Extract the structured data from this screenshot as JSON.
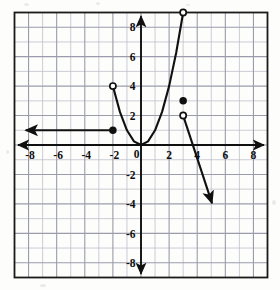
{
  "chart_data": {
    "type": "line",
    "title": "",
    "xlabel": "",
    "ylabel": "",
    "xlim": [
      -9,
      9
    ],
    "ylim": [
      -9,
      9
    ],
    "grid": true,
    "grid_step": 1,
    "tick_step": 2,
    "legend": "none",
    "xticks": [
      -8,
      -6,
      -4,
      -2,
      0,
      2,
      4,
      6,
      8
    ],
    "yticks": [
      8,
      6,
      4,
      2,
      -2,
      -4,
      -6,
      -8
    ],
    "xtick_labels": [
      "-8",
      "-6",
      "-4",
      "-2",
      "0",
      "2",
      "4",
      "6",
      "8"
    ],
    "ytick_labels": [
      "8",
      "6",
      "4",
      "2",
      "-2",
      "-4",
      "-6",
      "-8"
    ],
    "origin_label": "0",
    "axis_arrows": [
      "left",
      "right",
      "up",
      "down"
    ],
    "series": [
      {
        "name": "constant-ray",
        "shape": "ray",
        "values": [
          [
            -2,
            1
          ],
          [
            -8.2,
            1
          ]
        ],
        "arrow_at_end": true,
        "endpoint_start": "closed",
        "endpoint_end": "none"
      },
      {
        "name": "parabola-branch",
        "shape": "parabola",
        "equation": "y = x^2",
        "domain": [
          -2,
          3
        ],
        "vertex": [
          0,
          0
        ],
        "values": [
          [
            -2,
            4
          ],
          [
            -1.5,
            2.25
          ],
          [
            -1,
            1
          ],
          [
            -0.5,
            0.25
          ],
          [
            0,
            0
          ],
          [
            0.5,
            0.25
          ],
          [
            1,
            1
          ],
          [
            1.5,
            2.25
          ],
          [
            2,
            4
          ],
          [
            2.5,
            6.25
          ],
          [
            3,
            9
          ]
        ],
        "endpoint_start": "open",
        "endpoint_end": "open",
        "arrow_at_end": false
      },
      {
        "name": "descending-ray",
        "shape": "ray",
        "values": [
          [
            3,
            2
          ],
          [
            5.05,
            -3.95
          ]
        ],
        "arrow_at_end": true,
        "endpoint_start": "open",
        "endpoint_end": "none"
      }
    ],
    "points": [
      {
        "name": "closed-point-left-ray",
        "x": -2,
        "y": 1,
        "style": "closed"
      },
      {
        "name": "open-point-parabola-left",
        "x": -2,
        "y": 4,
        "style": "open"
      },
      {
        "name": "open-point-parabola-top",
        "x": 3,
        "y": 9,
        "style": "open"
      },
      {
        "name": "closed-point-isolated",
        "x": 3,
        "y": 3,
        "style": "closed"
      },
      {
        "name": "open-point-descending-ray",
        "x": 3,
        "y": 2,
        "style": "open"
      }
    ],
    "colors": {
      "curve": "#101010",
      "axis": "#101010",
      "grid_minor": "#b7b9c4",
      "grid_major": "#9a9cab",
      "frame": "#1a1a1a",
      "background": "#fdfdfc",
      "marker_fill_open": "#ffffff"
    }
  }
}
